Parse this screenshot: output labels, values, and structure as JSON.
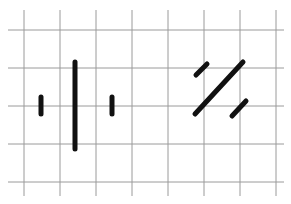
{
  "diagram": {
    "background": "#ffffff",
    "grid": {
      "color": "#9a9a9a",
      "stroke_width": 1,
      "vertical_x": [
        24,
        60,
        96,
        132,
        168,
        204,
        240,
        276
      ],
      "horizontal_y": [
        30,
        68,
        106,
        144,
        182
      ],
      "x_span": [
        8,
        284
      ],
      "y_span": [
        10,
        196
      ]
    },
    "ink_color": "#111111",
    "left_group": {
      "name": "vertical-strokes",
      "strokes": [
        {
          "id": "short-left",
          "x1": 41,
          "y1": 97,
          "x2": 41,
          "y2": 114,
          "width": 5
        },
        {
          "id": "tall-center",
          "x1": 75,
          "y1": 62,
          "x2": 75,
          "y2": 149,
          "width": 5
        },
        {
          "id": "short-right",
          "x1": 112,
          "y1": 97,
          "x2": 112,
          "y2": 114,
          "width": 5
        }
      ]
    },
    "right_group": {
      "name": "diagonal-strokes",
      "strokes": [
        {
          "id": "short-upper-left",
          "x1": 196,
          "y1": 75,
          "x2": 207,
          "y2": 64,
          "width": 5
        },
        {
          "id": "long-diagonal",
          "x1": 195,
          "y1": 114,
          "x2": 243,
          "y2": 62,
          "width": 5
        },
        {
          "id": "short-lower-right",
          "x1": 232,
          "y1": 116,
          "x2": 246,
          "y2": 101,
          "width": 5
        }
      ]
    },
    "cropped_caption_fragment": ""
  }
}
